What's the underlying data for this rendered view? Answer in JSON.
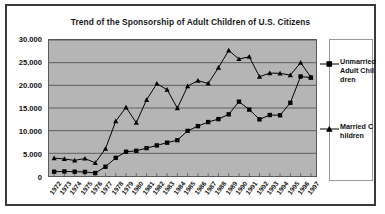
{
  "chart_data": {
    "type": "line",
    "title": "Trend of the Sponsorship of Adult Children of U.S. Citizens",
    "xlabel": "",
    "ylabel": "",
    "ylim": [
      0,
      30000
    ],
    "ytick_step": 5000,
    "ytick_labels": [
      "30.000",
      "25.000",
      "20.000",
      "15.000",
      "10.000",
      "5.000",
      "0"
    ],
    "ytick_values": [
      30000,
      25000,
      20000,
      15000,
      10000,
      5000,
      0
    ],
    "grid": true,
    "grid_axis": "y",
    "legend_position": "right",
    "plot_background": "#b5b5b5",
    "series_color": "#000000",
    "categories": [
      "1972",
      "1973",
      "1974",
      "1975",
      "1976",
      "1977",
      "1978",
      "1979",
      "1980",
      "1981",
      "1982",
      "1983",
      "1984",
      "1985",
      "1986",
      "1987",
      "1988",
      "1989",
      "1990",
      "1991",
      "1992",
      "1993",
      "1994",
      "1995",
      "1996",
      "1997"
    ],
    "series": [
      {
        "name": "Unmarried Adult Children",
        "legend_label": "Unmarried Adult Children",
        "marker": "square",
        "values": [
          950,
          1000,
          950,
          900,
          650,
          2050,
          4000,
          5350,
          5550,
          6150,
          6750,
          7350,
          7900,
          9950,
          11000,
          11900,
          12550,
          13600,
          16400,
          14650,
          12500,
          13450,
          13400,
          16150,
          21950,
          21700
        ]
      },
      {
        "name": "Married Children",
        "legend_label": "Married Children",
        "marker": "triangle",
        "values": [
          3950,
          3750,
          3450,
          3850,
          2900,
          6000,
          12100,
          15150,
          11750,
          16800,
          20350,
          19050,
          14950,
          19800,
          21050,
          20400,
          23900,
          27700,
          25800,
          26300,
          21900,
          22700,
          22650,
          22250,
          25000,
          21800
        ]
      }
    ]
  },
  "legend": {
    "entries": [
      {
        "label": "Unmarried Adult Children",
        "marker": "square"
      },
      {
        "label": "Married Children",
        "marker": "triangle"
      }
    ]
  }
}
